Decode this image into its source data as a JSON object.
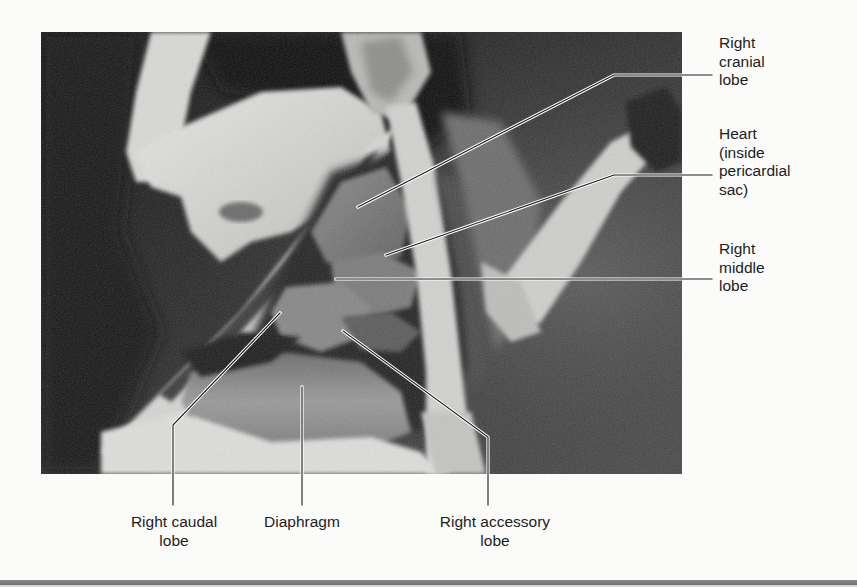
{
  "figure": {
    "type": "anatomical dissection photograph with labels",
    "labels_right": [
      {
        "id": "right-cranial-lobe",
        "lines": [
          "Right",
          "cranial",
          "lobe"
        ],
        "text": "Right cranial lobe"
      },
      {
        "id": "heart",
        "lines": [
          "Heart",
          "(inside",
          "pericardial",
          "sac)"
        ],
        "text": "Heart (inside pericardial sac)"
      },
      {
        "id": "right-middle-lobe",
        "lines": [
          "Right",
          "middle",
          "lobe"
        ],
        "text": "Right middle lobe"
      }
    ],
    "labels_bottom": [
      {
        "id": "right-caudal-lobe",
        "lines": [
          "Right caudal",
          "lobe"
        ],
        "text": "Right caudal lobe"
      },
      {
        "id": "diaphragm",
        "lines": [
          "Diaphragm"
        ],
        "text": "Diaphragm"
      },
      {
        "id": "right-accessory-lobe",
        "lines": [
          "Right accessory",
          "lobe"
        ],
        "text": "Right accessory lobe"
      }
    ],
    "colors": {
      "background": "#fbfbfa",
      "label_text": "#1d1d1d",
      "leader_line": "#1a1a1a",
      "leader_outline": "#ffffff",
      "bottom_rule": "#7a7a7a"
    }
  }
}
